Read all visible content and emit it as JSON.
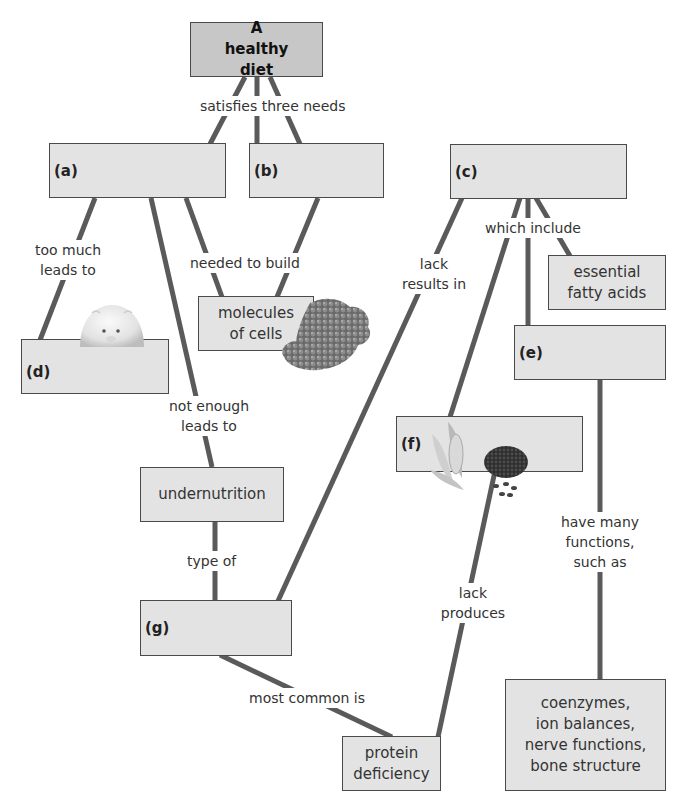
{
  "diagram": {
    "type": "concept-map",
    "root": {
      "label": "A healthy diet"
    },
    "nodes": {
      "a": {
        "letter": "(a)",
        "text": ""
      },
      "b": {
        "letter": "(b)",
        "text": ""
      },
      "c": {
        "letter": "(c)",
        "text": ""
      },
      "d": {
        "letter": "(d)",
        "text": ""
      },
      "e": {
        "letter": "(e)",
        "text": ""
      },
      "f": {
        "letter": "(f)",
        "text": ""
      },
      "g": {
        "letter": "(g)",
        "text": ""
      },
      "essential_fatty_acids": {
        "line1": "essential",
        "line2": "fatty acids"
      },
      "molecules_of_cells": {
        "line1": "molecules",
        "line2": "of cells"
      },
      "undernutrition": {
        "text": "undernutrition"
      },
      "protein_deficiency": {
        "line1": "protein",
        "line2": "deficiency"
      },
      "functions": {
        "line1": "coenzymes,",
        "line2": "ion balances,",
        "line3": "nerve functions,",
        "line4": "bone structure"
      }
    },
    "links": {
      "satisfies": "satisfies three needs",
      "too_much_1": "too much",
      "too_much_2": "leads to",
      "needed_to_build": "needed to build",
      "lack_results_1": "lack",
      "lack_results_2": "results in",
      "which_include": "which include",
      "not_enough_1": "not enough",
      "not_enough_2": "leads to",
      "type_of": "type of",
      "lack_produces_1": "lack",
      "lack_produces_2": "produces",
      "have_many_1": "have many",
      "have_many_2": "functions,",
      "have_many_3": "such as",
      "most_common": "most common is"
    },
    "colors": {
      "box_fill": "#e3e3e3",
      "root_fill": "#c7c7c7",
      "border": "#4a4a4a",
      "connector": "#5a5a5a"
    }
  }
}
